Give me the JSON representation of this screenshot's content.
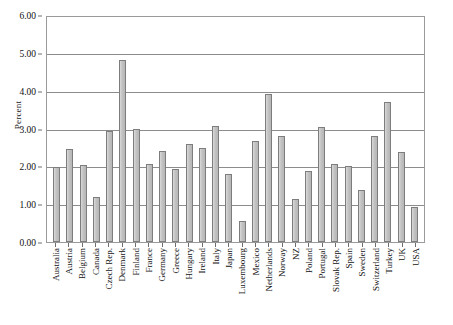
{
  "chart_data": {
    "type": "bar",
    "title": "",
    "xlabel": "",
    "ylabel": "Percent",
    "ylim": [
      0,
      6
    ],
    "ytick_step": 1,
    "ytick_labels": [
      "0.00",
      "1.00",
      "2.00",
      "3.00",
      "4.00",
      "5.00",
      "6.00"
    ],
    "ytick_values": [
      0,
      1,
      2,
      3,
      4,
      5,
      6
    ],
    "grid": "horizontal",
    "legend": "none",
    "bar_fill_color": "#bcbcbc",
    "bar_border_color": "#7d7d7d",
    "plot_border_color": "#9a9a9a",
    "gridline_color": "#8c8c8c",
    "background_color": "#ffffff",
    "categories": [
      "Australia",
      "Austria",
      "Belgium",
      "Canada",
      "Czech Rep.",
      "Denmark",
      "Finland",
      "France",
      "Germany",
      "Greece",
      "Hungary",
      "Ireland",
      "Italy",
      "Japan",
      "Luxembourg",
      "Mexico",
      "Netherlands",
      "Norway",
      "NZ",
      "Poland",
      "Portugal",
      "Slovak Rep.",
      "Spain",
      "Sweden",
      "Switzerland",
      "Turkey",
      "UK",
      "USA"
    ],
    "values": [
      1.97,
      2.46,
      2.04,
      1.18,
      2.94,
      4.82,
      2.99,
      2.07,
      2.41,
      1.93,
      2.58,
      2.48,
      3.07,
      1.79,
      0.55,
      2.66,
      3.92,
      2.79,
      1.15,
      1.87,
      3.05,
      2.07,
      2.0,
      1.38,
      2.79,
      3.71,
      2.39,
      0.93
    ]
  }
}
